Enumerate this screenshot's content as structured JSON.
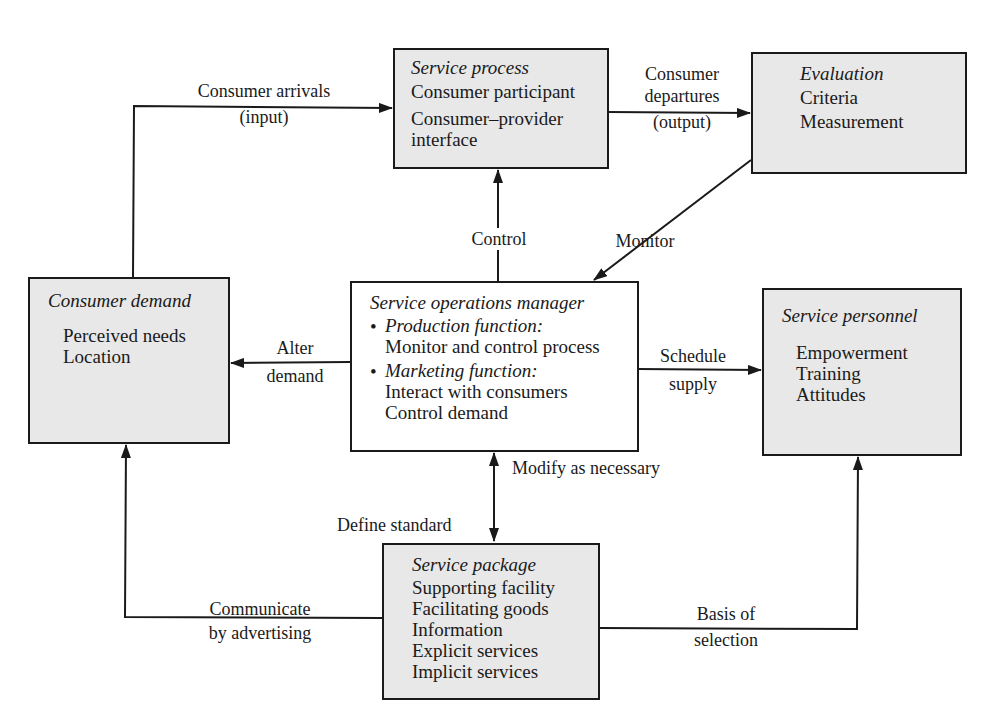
{
  "diagram": {
    "top_fragment": "",
    "nodes": {
      "service_process": {
        "title": "Service process",
        "lines": [
          "Consumer participant",
          "Consumer–provider",
          "interface"
        ]
      },
      "evaluation": {
        "title": "Evaluation",
        "lines": [
          "Criteria",
          "Measurement"
        ]
      },
      "consumer_demand": {
        "title": "Consumer demand",
        "lines": [
          "Perceived needs",
          "Location"
        ]
      },
      "service_operations_manager": {
        "title": "Service operations manager",
        "bullets": [
          {
            "heading": "Production function:",
            "lines": [
              "Monitor and control process"
            ]
          },
          {
            "heading": "Marketing function:",
            "lines": [
              "Interact with consumers",
              "Control demand"
            ]
          }
        ],
        "bullet_glyph": "•"
      },
      "service_personnel": {
        "title": "Service personnel",
        "lines": [
          "Empowerment",
          "Training",
          "Attitudes"
        ]
      },
      "service_package": {
        "title": "Service package",
        "lines": [
          "Supporting facility",
          "Facilitating goods",
          "Information",
          "Explicit services",
          "Implicit services"
        ]
      }
    },
    "edges": {
      "consumer_arrivals": {
        "line1": "Consumer arrivals",
        "line2": "(input)",
        "from": "consumer_demand",
        "to": "service_process"
      },
      "consumer_departures": {
        "line1": "Consumer",
        "line2": "departures",
        "line3": "(output)",
        "from": "service_process",
        "to": "evaluation"
      },
      "control": {
        "label": "Control",
        "from": "service_operations_manager",
        "to": "service_process"
      },
      "monitor": {
        "label": "Monitor",
        "from": "evaluation",
        "to": "service_operations_manager"
      },
      "alter_demand": {
        "line1": "Alter",
        "line2": "demand",
        "from": "service_operations_manager",
        "to": "consumer_demand"
      },
      "schedule_supply": {
        "line1": "Schedule",
        "line2": "supply",
        "from": "service_operations_manager",
        "to": "service_personnel"
      },
      "modify_as_necessary": {
        "label": "Modify as necessary",
        "from": "service_package",
        "to": "service_operations_manager"
      },
      "define_standard": {
        "label": "Define standard",
        "from": "service_operations_manager",
        "to": "service_package"
      },
      "communicate_by_advertising": {
        "line1": "Communicate",
        "line2": "by advertising",
        "from": "service_package",
        "to": "consumer_demand"
      },
      "basis_of_selection": {
        "line1": "Basis of",
        "line2": "selection",
        "from": "service_package",
        "to": "service_personnel"
      }
    },
    "colors": {
      "box_fill": "#e8e8e8",
      "manager_fill": "#ffffff",
      "stroke": "#1a1a1a"
    }
  }
}
